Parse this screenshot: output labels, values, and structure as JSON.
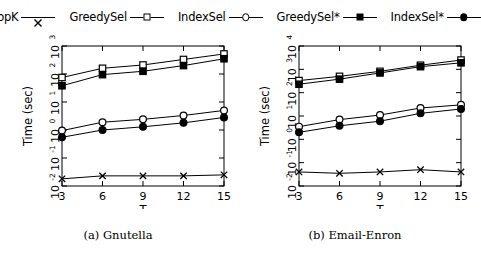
{
  "legend": {
    "entries": [
      {
        "label": "TopK",
        "marker": "cross-icon"
      },
      {
        "label": "GreedySel",
        "marker": "square-open-icon"
      },
      {
        "label": "IndexSel",
        "marker": "circle-open-icon"
      },
      {
        "label": "GreedySel*",
        "marker": "square-filled-icon"
      },
      {
        "label": "IndexSel*",
        "marker": "circle-filled-icon"
      }
    ]
  },
  "captions": {
    "a": "(a) Gnutella",
    "b": "(b) Email-Enron"
  },
  "chart_data": [
    {
      "type": "line",
      "title": "(a) Gnutella",
      "xlabel": "T",
      "ylabel": "Time (sec)",
      "x": [
        3,
        6,
        9,
        12,
        15
      ],
      "xticklabels": [
        "3",
        "6",
        "9",
        "12",
        "15"
      ],
      "yscale": "log",
      "ylim": [
        0.01,
        1000
      ],
      "yticklabels": [
        "10-2",
        "10-1",
        "100",
        "101",
        "102",
        "103"
      ],
      "ytickvalues": [
        0.01,
        0.1,
        1,
        10,
        100,
        1000
      ],
      "grid": false,
      "legend_position": "top",
      "series": [
        {
          "name": "TopK",
          "marker": "cross-icon",
          "values": [
            0.018,
            0.023,
            0.023,
            0.023,
            0.025
          ]
        },
        {
          "name": "GreedySel",
          "marker": "square-open-icon",
          "values": [
            75,
            160,
            210,
            330,
            520
          ]
        },
        {
          "name": "IndexSel",
          "marker": "circle-open-icon",
          "values": [
            0.95,
            1.9,
            2.4,
            3.3,
            5.0
          ]
        },
        {
          "name": "GreedySel*",
          "marker": "square-filled-icon",
          "values": [
            38,
            95,
            125,
            200,
            350
          ]
        },
        {
          "name": "IndexSel*",
          "marker": "circle-filled-icon",
          "values": [
            0.55,
            1.0,
            1.3,
            1.8,
            2.8
          ]
        }
      ]
    },
    {
      "type": "line",
      "title": "(b) Email-Enron",
      "xlabel": "T",
      "ylabel": "Time (sec)",
      "x": [
        3,
        6,
        9,
        12,
        15
      ],
      "xticklabels": [
        "3",
        "6",
        "9",
        "12",
        "15"
      ],
      "yscale": "log",
      "ylim": [
        0.01,
        10000
      ],
      "yticklabels": [
        "10-2",
        "10-1",
        "100",
        "101",
        "102",
        "103",
        "104"
      ],
      "ytickvalues": [
        0.01,
        0.1,
        1,
        10,
        100,
        1000,
        10000
      ],
      "grid": false,
      "legend_position": "top",
      "series": [
        {
          "name": "TopK",
          "marker": "cross-icon",
          "values": [
            0.04,
            0.035,
            0.04,
            0.05,
            0.04
          ]
        },
        {
          "name": "GreedySel",
          "marker": "square-open-icon",
          "values": [
            330,
            500,
            820,
            1500,
            2500
          ]
        },
        {
          "name": "IndexSel",
          "marker": "circle-open-icon",
          "values": [
            3.5,
            7.0,
            11,
            22,
            30
          ]
        },
        {
          "name": "GreedySel*",
          "marker": "square-filled-icon",
          "values": [
            230,
            380,
            700,
            1300,
            1900
          ]
        },
        {
          "name": "IndexSel*",
          "marker": "circle-filled-icon",
          "values": [
            2.0,
            3.8,
            6.0,
            13,
            20
          ]
        }
      ]
    }
  ]
}
